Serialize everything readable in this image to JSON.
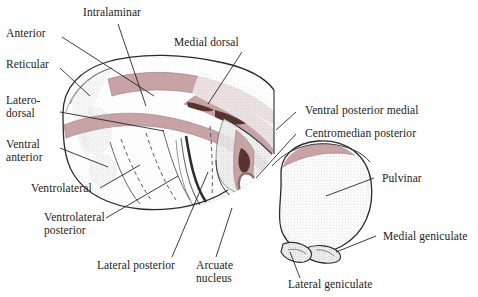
{
  "figure": {
    "background_color": "#ffffff",
    "text_color": "#1b1b1b",
    "lamina_color": "#c7a3a6",
    "lamina_dark_color": "#5c3a34",
    "outline_color": "#2b2b2b",
    "stipple_color": "#8d8d8d"
  },
  "labels": {
    "intralaminar": "Intralaminar",
    "anterior": "Anterior",
    "medial_dorsal": "Medial dorsal",
    "reticular": "Reticular",
    "latero_dorsal_line1": "Latero-",
    "latero_dorsal_line2": "dorsal",
    "ventral_anterior_line1": "Ventral",
    "ventral_anterior_line2": "anterior",
    "ventrolateral": "Ventrolateral",
    "ventrolateral_posterior_line1": "Ventrolateral",
    "ventrolateral_posterior_line2": "posterior",
    "lateral_posterior": "Lateral posterior",
    "arcuate_nucleus_line1": "Arcuate",
    "arcuate_nucleus_line2": "nucleus",
    "ventral_posterior_medial": "Ventral posterior medial",
    "centromedian_posterior": "Centromedian posterior",
    "pulvinar": "Pulvinar",
    "medial_geniculate": "Medial geniculate",
    "lateral_geniculate": "Lateral geniculate"
  },
  "structures": [
    {
      "name": "intralaminar-lamina",
      "kind": "band",
      "color": "#c7a3a6"
    },
    {
      "name": "anterior-nucleus",
      "kind": "region"
    },
    {
      "name": "medial-dorsal-nucleus",
      "kind": "region"
    },
    {
      "name": "reticular-nucleus",
      "kind": "region"
    },
    {
      "name": "laterodorsal-nucleus",
      "kind": "region"
    },
    {
      "name": "ventral-anterior-nucleus",
      "kind": "region"
    },
    {
      "name": "ventrolateral-nucleus",
      "kind": "region"
    },
    {
      "name": "ventrolateral-posterior-nucleus",
      "kind": "region"
    },
    {
      "name": "lateral-posterior-nucleus",
      "kind": "region"
    },
    {
      "name": "arcuate-nucleus",
      "kind": "region"
    },
    {
      "name": "ventral-posterior-medial-nucleus",
      "kind": "region"
    },
    {
      "name": "centromedian-posterior-nucleus",
      "kind": "ring"
    },
    {
      "name": "pulvinar",
      "kind": "mass"
    },
    {
      "name": "medial-geniculate-body",
      "kind": "mass"
    },
    {
      "name": "lateral-geniculate-body",
      "kind": "mass"
    }
  ]
}
